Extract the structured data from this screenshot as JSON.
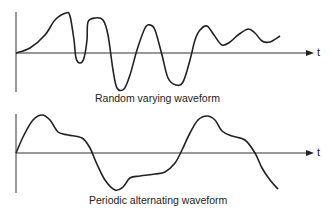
{
  "chart_data": [
    {
      "type": "line",
      "title": "Random varying waveform",
      "xlabel": "t",
      "ylabel": "",
      "grid": false,
      "description": "Irregular waveform with varying amplitude and frequency over time",
      "points": [
        [
          16,
          53
        ],
        [
          30,
          48
        ],
        [
          45,
          35
        ],
        [
          55,
          20
        ],
        [
          66,
          13
        ],
        [
          70,
          16
        ],
        [
          74,
          40
        ],
        [
          76,
          58
        ],
        [
          80,
          63
        ],
        [
          84,
          58
        ],
        [
          87,
          40
        ],
        [
          88,
          22
        ],
        [
          95,
          18
        ],
        [
          103,
          20
        ],
        [
          108,
          35
        ],
        [
          113,
          70
        ],
        [
          117,
          88
        ],
        [
          124,
          89
        ],
        [
          130,
          75
        ],
        [
          137,
          50
        ],
        [
          145,
          28
        ],
        [
          150,
          25
        ],
        [
          155,
          30
        ],
        [
          162,
          55
        ],
        [
          168,
          78
        ],
        [
          176,
          85
        ],
        [
          183,
          82
        ],
        [
          190,
          60
        ],
        [
          195,
          40
        ],
        [
          200,
          30
        ],
        [
          207,
          26
        ],
        [
          214,
          35
        ],
        [
          222,
          45
        ],
        [
          230,
          42
        ],
        [
          238,
          35
        ],
        [
          248,
          29
        ],
        [
          255,
          33
        ],
        [
          262,
          41
        ],
        [
          270,
          42
        ],
        [
          280,
          36
        ]
      ]
    },
    {
      "type": "line",
      "title": "Periodic alternating waveform",
      "xlabel": "t",
      "ylabel": "",
      "grid": false,
      "description": "Repeating waveform alternating above and below the time axis",
      "points": [
        [
          16,
          153
        ],
        [
          24,
          135
        ],
        [
          33,
          120
        ],
        [
          42,
          115
        ],
        [
          50,
          120
        ],
        [
          58,
          132
        ],
        [
          68,
          135
        ],
        [
          82,
          138
        ],
        [
          90,
          148
        ],
        [
          96,
          162
        ],
        [
          105,
          180
        ],
        [
          115,
          190
        ],
        [
          123,
          187
        ],
        [
          130,
          178
        ],
        [
          140,
          176
        ],
        [
          155,
          174
        ],
        [
          165,
          172
        ],
        [
          175,
          163
        ],
        [
          182,
          150
        ],
        [
          190,
          133
        ],
        [
          198,
          120
        ],
        [
          207,
          116
        ],
        [
          215,
          120
        ],
        [
          222,
          131
        ],
        [
          232,
          136
        ],
        [
          245,
          140
        ],
        [
          255,
          153
        ],
        [
          262,
          168
        ],
        [
          270,
          180
        ],
        [
          278,
          189
        ]
      ]
    }
  ],
  "labels": {
    "top_caption": "Random varying waveform",
    "bottom_caption": "Periodic alternating waveform",
    "t_label": "t"
  }
}
